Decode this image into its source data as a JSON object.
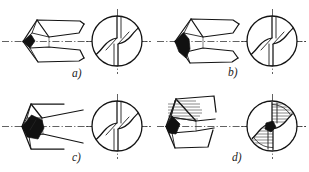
{
  "figure": {
    "background_color": "#ffffff",
    "line_color": "#141414",
    "wear_fill_color": "#111111",
    "centerline_color": "#2d2d2d",
    "canvas": {
      "width": 309,
      "height": 172
    }
  },
  "panels": [
    {
      "id": "a",
      "label": "a)",
      "label_x": 72,
      "label_y": 77,
      "wear_stage": "initial",
      "wear_style": "small-solid-wedge",
      "side_view": {
        "x": 6,
        "y": 12,
        "width": 78,
        "height": 58
      },
      "end_view": {
        "cx": 117,
        "cy": 41,
        "r": 26
      }
    },
    {
      "id": "b",
      "label": "b)",
      "label_x": 228,
      "label_y": 76,
      "wear_stage": "moderate",
      "wear_style": "large-solid-wedge",
      "side_view": {
        "x": 161,
        "y": 12,
        "width": 78,
        "height": 58
      },
      "end_view": {
        "cx": 272,
        "cy": 41,
        "r": 26
      }
    },
    {
      "id": "c",
      "label": "c)",
      "label_x": 72,
      "label_y": 161,
      "wear_stage": "advanced",
      "wear_style": "rhombus-solid-block",
      "side_view": {
        "x": 6,
        "y": 97,
        "width": 78,
        "height": 58
      },
      "end_view": {
        "cx": 117,
        "cy": 126,
        "r": 26
      }
    },
    {
      "id": "d",
      "label": "d)",
      "label_x": 232,
      "label_y": 161,
      "wear_stage": "severe",
      "wear_style": "hatched-blunt-tip",
      "side_view": {
        "x": 161,
        "y": 97,
        "width": 78,
        "height": 58
      },
      "end_view": {
        "cx": 272,
        "cy": 126,
        "r": 26
      }
    }
  ],
  "icons": {
    "centerline": "dash-dot-axis",
    "flute": "helical-flute-curve",
    "hatching": "section-hatch-lines"
  }
}
